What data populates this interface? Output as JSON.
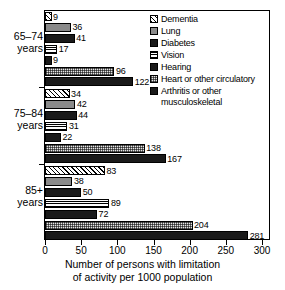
{
  "chart_data": {
    "type": "bar",
    "orientation": "horizontal",
    "title": "",
    "xlabel_line1": "Number of persons with limitation",
    "xlabel_line2": "of activity per 1000 population",
    "ylabel": "",
    "xlim": [
      0,
      300
    ],
    "xticks": [
      0,
      50,
      100,
      150,
      200,
      250,
      300
    ],
    "xticklabels": [
      "0",
      "50",
      "100",
      "150",
      "200",
      "250",
      "300"
    ],
    "grid": false,
    "legend_position": "top-right",
    "categories": [
      "65–74 years",
      "75–84 years",
      "85+ years"
    ],
    "category_labels": [
      {
        "line1": "65–74",
        "line2": "years"
      },
      {
        "line1": "75–84",
        "line2": "years"
      },
      {
        "line1": "85+",
        "line2": "years"
      }
    ],
    "series": [
      {
        "name": "Dementia",
        "pattern": "diagonal-hatch",
        "values": [
          9,
          34,
          83
        ]
      },
      {
        "name": "Lung",
        "pattern": "solid-gray",
        "values": [
          36,
          42,
          38
        ]
      },
      {
        "name": "Diabetes",
        "pattern": "solid-black",
        "values": [
          41,
          44,
          50
        ]
      },
      {
        "name": "Vision",
        "pattern": "horizontal-lines",
        "values": [
          17,
          31,
          89
        ]
      },
      {
        "name": "Hearing",
        "pattern": "solid-black",
        "values": [
          9,
          22,
          72
        ]
      },
      {
        "name": "Heart or other circulatory",
        "pattern": "light-stipple",
        "values": [
          96,
          138,
          204
        ]
      },
      {
        "name": "Arthritis or other musculoskeletal",
        "pattern": "solid-black",
        "values": [
          122,
          167,
          281
        ]
      }
    ],
    "legend_entries": [
      {
        "label": "Dementia",
        "pattern": "diagonal-hatch"
      },
      {
        "label": "Lung",
        "pattern": "solid-gray"
      },
      {
        "label": "Diabetes",
        "pattern": "solid-black"
      },
      {
        "label": "Vision",
        "pattern": "horizontal-lines"
      },
      {
        "label": "Hearing",
        "pattern": "solid-black"
      },
      {
        "label": "Heart or other circulatory",
        "pattern": "light-stipple"
      },
      {
        "label": "Arthritis or other musculoskeletal",
        "pattern": "solid-black"
      }
    ],
    "colors": {
      "axis": "#000000",
      "gray_fill": "#8a8a8a",
      "black_fill": "#1a1a1a",
      "stipple_fill": "#e6e6e6",
      "background": "#ffffff"
    }
  }
}
